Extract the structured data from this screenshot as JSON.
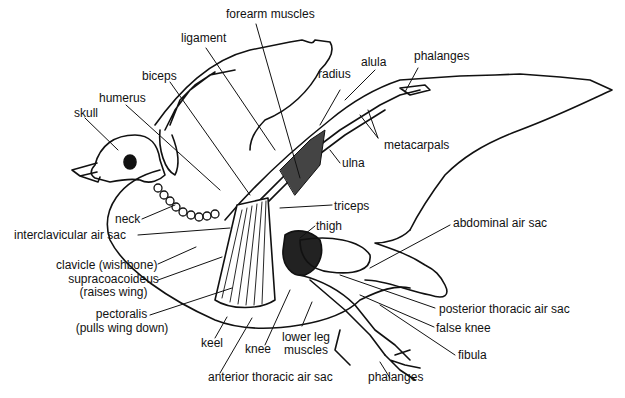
{
  "diagram": {
    "labels": {
      "forearm_muscles": "forearm muscles",
      "ligament": "ligament",
      "biceps": "biceps",
      "humerus": "humerus",
      "skull": "skull",
      "radius": "radius",
      "alula": "alula",
      "phalanges_wing": "phalanges",
      "metacarpals": "metacarpals",
      "ulna": "ulna",
      "triceps": "triceps",
      "thigh": "thigh",
      "abdominal_air_sac": "abdominal air sac",
      "neck": "neck",
      "interclavicular_air_sac": "interclavicular air sac",
      "clavicle_1": "clavicle (wishbone)",
      "supracoacoideus_1": "supracoacoideus",
      "supracoacoideus_2": "(raises wing)",
      "pectoralis_1": "pectoralis",
      "pectoralis_2": "(pulls wing down)",
      "keel": "keel",
      "knee": "knee",
      "lower_leg_muscles_1": "lower leg",
      "lower_leg_muscles_2": "muscles",
      "anterior_thoracic_air_sac": "anterior thoracic air sac",
      "posterior_thoracic_air_sac": "posterior thoracic air sac",
      "false_knee": "false knee",
      "fibula": "fibula",
      "phalanges_foot": "phalanges"
    }
  }
}
